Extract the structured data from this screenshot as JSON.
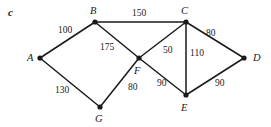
{
  "figure": {
    "part_label": "c",
    "background_color": "#ffffff",
    "ink_color": "#1a1a1a"
  },
  "chart_data": {
    "type": "diagram",
    "subtype": "weighted-undirected-graph",
    "title": "",
    "nodes": [
      {
        "id": "A",
        "label": "A",
        "x": 40,
        "y": 58,
        "label_x": 27,
        "label_y": 53
      },
      {
        "id": "B",
        "label": "B",
        "x": 95,
        "y": 22,
        "label_x": 90,
        "label_y": 6
      },
      {
        "id": "C",
        "label": "C",
        "x": 186,
        "y": 22,
        "label_x": 181,
        "label_y": 6
      },
      {
        "id": "D",
        "label": "D",
        "x": 244,
        "y": 58,
        "label_x": 253,
        "label_y": 53
      },
      {
        "id": "E",
        "label": "E",
        "x": 186,
        "y": 95,
        "label_x": 181,
        "label_y": 103
      },
      {
        "id": "F",
        "label": "F",
        "x": 139,
        "y": 58,
        "label_x": 134,
        "label_y": 66
      },
      {
        "id": "G",
        "label": "G",
        "x": 100,
        "y": 107,
        "label_x": 95,
        "label_y": 114
      }
    ],
    "edges": [
      {
        "source": "A",
        "target": "B",
        "weight": 100,
        "label_x": 58,
        "label_y": 26
      },
      {
        "source": "B",
        "target": "C",
        "weight": 150,
        "label_x": 132,
        "label_y": 9
      },
      {
        "source": "B",
        "target": "F",
        "weight": 175,
        "label_x": 100,
        "label_y": 43
      },
      {
        "source": "C",
        "target": "D",
        "weight": 80,
        "label_x": 206,
        "label_y": 29
      },
      {
        "source": "C",
        "target": "E",
        "weight": 110,
        "label_x": 190,
        "label_y": 49
      },
      {
        "source": "C",
        "target": "F",
        "weight": 50,
        "label_x": 163,
        "label_y": 46
      },
      {
        "source": "D",
        "target": "E",
        "weight": 90,
        "label_x": 215,
        "label_y": 79
      },
      {
        "source": "E",
        "target": "F",
        "weight": 90,
        "label_x": 157,
        "label_y": 79
      },
      {
        "source": "F",
        "target": "G",
        "weight": 80,
        "label_x": 128,
        "label_y": 83
      },
      {
        "source": "G",
        "target": "A",
        "weight": 130,
        "label_x": 55,
        "label_y": 86
      }
    ]
  }
}
